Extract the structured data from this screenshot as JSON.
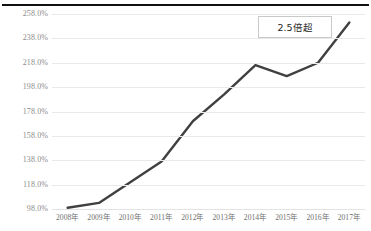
{
  "chart_data": {
    "type": "line",
    "title": "",
    "subtitle": "",
    "xlabel": "",
    "ylabel": "",
    "categories": [
      "2008年",
      "2009年",
      "2010年",
      "2011年",
      "2012年",
      "2013年",
      "2014年",
      "2015年",
      "2016年",
      "2017年"
    ],
    "values": [
      99.0,
      103.0,
      120.0,
      137.0,
      170.0,
      192.0,
      216.0,
      207.0,
      218.0,
      251.0
    ],
    "series": [
      {
        "name": "指数",
        "values": [
          99.0,
          103.0,
          120.0,
          137.0,
          170.0,
          192.0,
          216.0,
          207.0,
          218.0,
          251.0
        ]
      }
    ],
    "ylim": [
      98.0,
      258.0
    ],
    "ytick_values": [
      98.0,
      118.0,
      138.0,
      158.0,
      178.0,
      198.0,
      218.0,
      238.0,
      258.0
    ],
    "ytick_labels": [
      "98.0%",
      "118.0%",
      "138.0%",
      "158.0%",
      "178.0%",
      "198.0%",
      "218.0%",
      "238.0%",
      "258.0%"
    ],
    "grid": true,
    "legend": false,
    "legend_position": "none",
    "line_color": "#404040",
    "gridline_color": "#e9e9e9",
    "annotations": [
      {
        "text": "2.5倍超",
        "kind": "callout-box",
        "position": "top-right"
      }
    ]
  },
  "annotation": {
    "label": "2.5倍超"
  }
}
